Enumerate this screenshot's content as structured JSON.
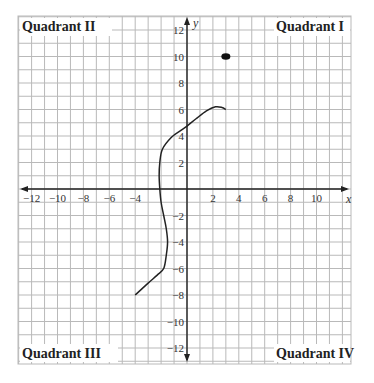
{
  "chart_data": {
    "type": "scatter",
    "title": "",
    "xlabel": "x",
    "ylabel": "y",
    "xlim": [
      -13,
      13
    ],
    "ylim": [
      -13,
      13
    ],
    "grid": true,
    "x_ticks": [
      -12,
      -10,
      -8,
      -6,
      -4,
      2,
      4,
      6,
      8,
      10
    ],
    "y_ticks": [
      12,
      10,
      8,
      6,
      4,
      2,
      -2,
      -4,
      -6,
      -8,
      -10,
      -12
    ],
    "quadrant_labels": {
      "q1": "Quadrant I",
      "q2": "Quadrant II",
      "q3": "Quadrant III",
      "q4": "Quadrant IV"
    },
    "series": [
      {
        "name": "curve",
        "kind": "line",
        "points": [
          [
            -4,
            -8
          ],
          [
            -3,
            -7.1
          ],
          [
            -2.3,
            -6.5
          ],
          [
            -1.8,
            -6
          ],
          [
            -1.6,
            -5
          ],
          [
            -1.5,
            -4
          ],
          [
            -1.6,
            -3
          ],
          [
            -1.8,
            -2
          ],
          [
            -2,
            -1
          ],
          [
            -2.1,
            0
          ],
          [
            -2.15,
            1
          ],
          [
            -2.1,
            2
          ],
          [
            -1.9,
            3
          ],
          [
            -1.2,
            3.9
          ],
          [
            -0.5,
            4.4
          ],
          [
            0,
            4.75
          ],
          [
            0.7,
            5.3
          ],
          [
            1.5,
            5.9
          ],
          [
            2.2,
            6.2
          ],
          [
            2.7,
            6.15
          ],
          [
            3,
            6
          ]
        ]
      },
      {
        "name": "point",
        "kind": "scatter",
        "points": [
          [
            3,
            10
          ]
        ]
      }
    ]
  }
}
